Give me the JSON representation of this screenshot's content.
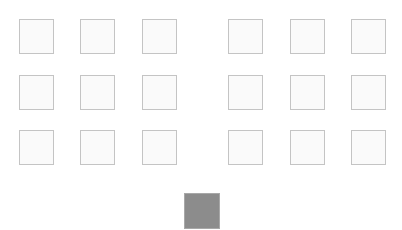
{
  "board": {
    "tile_color": "#fafafa",
    "tile_border": "#c4c4c4",
    "left_grid": {
      "rows": 3,
      "cols": 3,
      "x": [
        19,
        80,
        142
      ],
      "y": [
        19,
        75,
        130
      ]
    },
    "right_grid": {
      "rows": 3,
      "cols": 3,
      "x": [
        228,
        290,
        351
      ],
      "y": [
        19,
        75,
        130
      ]
    }
  },
  "active_tile": {
    "x": 184,
    "y": 193,
    "color": "#8c8c8c"
  }
}
